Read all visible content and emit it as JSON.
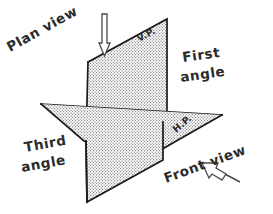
{
  "diagram": {
    "background_color": "#ffffff",
    "line_color": "#1a1a1a",
    "fill_pattern_color": "#9a9a9a",
    "text_color": "#2b2b2b",
    "labels": {
      "plan_view": "Plan view",
      "vertical_plane": "V.P.",
      "first_angle_line1": "First",
      "first_angle_line2": "angle",
      "horizontal_plane": "H.P.",
      "front_view": "Front view",
      "third_angle_line1": "Third",
      "third_angle_line2": "angle"
    },
    "arrows": {
      "plan_view_arrow": "down-arrow",
      "front_view_arrow": "up-left-arrow"
    },
    "geometry": {
      "vertical_plane_points": "88,62 167,19 167,122 163,160",
      "horizontal_plane_points": "41,104 222,115 143,160 84,141",
      "vertical_plane_bottom": "87,202"
    }
  }
}
